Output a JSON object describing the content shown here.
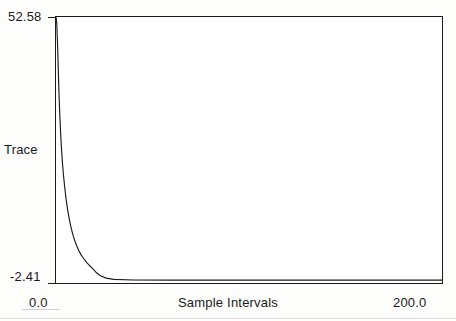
{
  "chart_data": {
    "type": "line",
    "title": "",
    "xlabel": "Sample Intervals",
    "ylabel": "Trace",
    "xlim": [
      0.0,
      200.0
    ],
    "ylim": [
      -2.41,
      52.58
    ],
    "xticks": [
      "0.0",
      "200.0"
    ],
    "yticks": [
      "52.58",
      "-2.41"
    ],
    "grid": false,
    "legend": "none",
    "series": [
      {
        "name": "Trace",
        "color": "#1b1b1b",
        "x": [
          0.0,
          0.4,
          0.8,
          1.2,
          1.6,
          2.0,
          2.6,
          3.2,
          3.8,
          4.4,
          5.2,
          6.0,
          6.8,
          7.6,
          8.6,
          9.6,
          10.6,
          11.8,
          13.0,
          14.4,
          16.0,
          17.6,
          19.4,
          21.0,
          23.0,
          26.0,
          30.0,
          40.0,
          60.0,
          90.0,
          130.0,
          170.0,
          200.0
        ],
        "y": [
          52.58,
          51.2,
          47.0,
          41.5,
          36.2,
          32.0,
          27.0,
          23.2,
          20.2,
          17.8,
          15.0,
          12.8,
          11.0,
          9.4,
          7.8,
          6.5,
          5.4,
          4.3,
          3.4,
          2.6,
          1.8,
          1.1,
          0.4,
          -0.3,
          -0.9,
          -1.4,
          -1.65,
          -1.78,
          -1.82,
          -1.83,
          -1.83,
          -1.83,
          -1.83
        ]
      }
    ]
  },
  "axes": {
    "y_max_label": "52.58",
    "y_min_label": "-2.41",
    "y_axis_label": "Trace",
    "x_min_label": "0.0",
    "x_max_label": "200.0",
    "x_axis_label": "Sample Intervals"
  }
}
